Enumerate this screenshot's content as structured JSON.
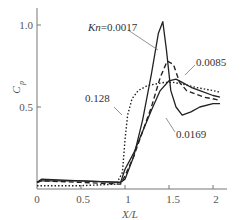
{
  "chart_data": {
    "type": "line",
    "title": "",
    "xlabel": "X/L",
    "ylabel": "C_p",
    "xlim": [
      0,
      2.15
    ],
    "ylim": [
      0,
      1.1
    ],
    "xticks": [
      0,
      0.5,
      1,
      1.5,
      2
    ],
    "xtick_labels": [
      "0",
      "0.5",
      "1",
      "1.5",
      "2"
    ],
    "yticks": [
      0.5,
      1.0
    ],
    "ytick_labels": [
      "0.5",
      "1.0"
    ],
    "grid": false,
    "legend": "inline annotations",
    "series": [
      {
        "name": "Kn=0.0017",
        "label": "Kn=0.0017",
        "style": "solid",
        "x": [
          0.0,
          0.05,
          0.5,
          0.95,
          1.0,
          1.1,
          1.2,
          1.3,
          1.38,
          1.43,
          1.47,
          1.52,
          1.58,
          1.65,
          1.75,
          1.85,
          2.0,
          2.08
        ],
        "y": [
          0.04,
          0.06,
          0.05,
          0.04,
          0.06,
          0.2,
          0.42,
          0.7,
          0.95,
          1.02,
          0.85,
          0.6,
          0.5,
          0.45,
          0.47,
          0.5,
          0.52,
          0.52
        ]
      },
      {
        "name": "0.0085",
        "label": "0.0085",
        "style": "dashed",
        "x": [
          0.0,
          0.05,
          0.5,
          0.95,
          1.0,
          1.1,
          1.2,
          1.3,
          1.4,
          1.48,
          1.55,
          1.62,
          1.7,
          1.8,
          1.9,
          2.0,
          2.08
        ],
        "y": [
          0.04,
          0.05,
          0.04,
          0.03,
          0.08,
          0.2,
          0.35,
          0.5,
          0.68,
          0.78,
          0.76,
          0.65,
          0.6,
          0.58,
          0.56,
          0.55,
          0.54
        ]
      },
      {
        "name": "0.0169",
        "label": "0.0169",
        "style": "solid",
        "x": [
          0.0,
          0.05,
          0.5,
          0.95,
          1.0,
          1.1,
          1.2,
          1.3,
          1.4,
          1.5,
          1.58,
          1.65,
          1.75,
          1.85,
          2.0,
          2.08
        ],
        "y": [
          0.04,
          0.05,
          0.05,
          0.04,
          0.12,
          0.22,
          0.35,
          0.48,
          0.6,
          0.66,
          0.67,
          0.65,
          0.62,
          0.6,
          0.57,
          0.56
        ]
      },
      {
        "name": "0.128",
        "label": "0.128",
        "style": "dotted",
        "x": [
          0.0,
          0.05,
          0.5,
          0.9,
          0.97,
          1.0,
          1.03,
          1.08,
          1.15,
          1.25,
          1.35,
          1.45,
          1.55,
          1.65,
          1.8,
          2.0,
          2.08
        ],
        "y": [
          0.02,
          0.02,
          0.02,
          0.03,
          0.1,
          0.3,
          0.45,
          0.55,
          0.6,
          0.63,
          0.64,
          0.65,
          0.65,
          0.64,
          0.62,
          0.6,
          0.59
        ]
      }
    ],
    "annotations": [
      {
        "text": "Kn=0.0017",
        "x": 1.0,
        "y": 0.97
      },
      {
        "text": "0.0085",
        "x": 1.72,
        "y": 0.8
      },
      {
        "text": "0.128",
        "x": 0.7,
        "y": 0.5
      },
      {
        "text": "0.0169",
        "x": 1.6,
        "y": 0.45
      }
    ]
  },
  "labels": {
    "ylabel_main": "C",
    "ylabel_sub": "p",
    "xlabel": "X/L",
    "annot_kn0017": "Kn=0.0017",
    "annot_0085": "0.0085",
    "annot_0128": "0.128",
    "annot_0169": "0.0169",
    "tick_x0": "0",
    "tick_x05": "0.5",
    "tick_x1": "1",
    "tick_x15": "1.5",
    "tick_x2": "2",
    "tick_y05": "0.5",
    "tick_y10": "1.0"
  }
}
